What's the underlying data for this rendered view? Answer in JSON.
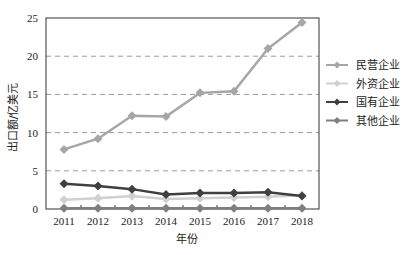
{
  "chart_data": {
    "type": "line",
    "title": "",
    "xlabel": "年份",
    "ylabel": "出口额/亿美元",
    "x": [
      "2011",
      "2012",
      "2013",
      "2014",
      "2015",
      "2016",
      "2017",
      "2018"
    ],
    "ylim": [
      0,
      25
    ],
    "yticks": [
      0,
      5,
      10,
      15,
      20,
      25
    ],
    "grid": {
      "y": true,
      "style": "dashed"
    },
    "legend_position": "right",
    "series": [
      {
        "name": "民营企业",
        "color": "#a6a6a6",
        "values": [
          7.8,
          9.2,
          12.2,
          12.1,
          15.2,
          15.4,
          21.0,
          24.4
        ]
      },
      {
        "name": "外资企业",
        "color": "#d0d0d0",
        "values": [
          1.2,
          1.4,
          1.7,
          1.3,
          1.4,
          1.5,
          1.6,
          1.8
        ]
      },
      {
        "name": "国有企业",
        "color": "#404040",
        "values": [
          3.3,
          3.0,
          2.6,
          1.9,
          2.1,
          2.1,
          2.2,
          1.7
        ]
      },
      {
        "name": "其他企业",
        "color": "#7f7f7f",
        "values": [
          0.1,
          0.1,
          0.1,
          0.1,
          0.1,
          0.1,
          0.1,
          0.1
        ]
      }
    ]
  }
}
